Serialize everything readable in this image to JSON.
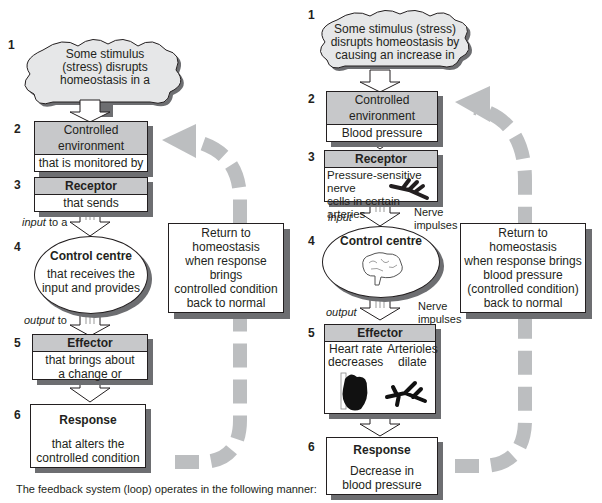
{
  "left": {
    "steps": [
      {
        "num": "1",
        "text_lines": [
          "Some stimulus",
          "(stress) disrupts",
          "homeostasis in a"
        ]
      },
      {
        "num": "2",
        "header": "Controlled environment",
        "body": "that is monitored by"
      },
      {
        "num": "3",
        "header": "Receptor",
        "body": "that sends"
      },
      {
        "num": "4",
        "header": "Control centre",
        "body_lines": [
          "that receives the",
          "input and provides"
        ]
      },
      {
        "num": "5",
        "header": "Effector",
        "body_lines": [
          "that brings about",
          "a change or"
        ]
      },
      {
        "num": "6",
        "header": "Response",
        "body_lines": [
          "that alters the",
          "controlled condition"
        ]
      }
    ],
    "input_label_italic": "input",
    "input_label_rest": " to a",
    "output_label_italic": "output",
    "output_label_rest": " to",
    "return_note_lines": [
      "Return to homeostasis",
      "when response brings",
      "controlled condition",
      "back to normal"
    ]
  },
  "right": {
    "steps": [
      {
        "num": "1",
        "text_lines": [
          "Some stimulus (stress)",
          "disrupts homeostasis by",
          "causing an increase in"
        ]
      },
      {
        "num": "2",
        "header": "Controlled environment",
        "body": "Blood pressure"
      },
      {
        "num": "3",
        "header": "Receptor",
        "body_lines": [
          "Pressure-sensitive nerve",
          "cells in certain",
          "arteries"
        ]
      },
      {
        "num": "4",
        "header": "Control centre"
      },
      {
        "num": "5",
        "header": "Effector",
        "col1_lines": [
          "Heart rate",
          "decreases"
        ],
        "col2_lines": [
          "Arterioles",
          "dilate"
        ]
      },
      {
        "num": "6",
        "header": "Response",
        "body_lines": [
          "Decrease in",
          "blood pressure"
        ]
      }
    ],
    "input_label": "input",
    "output_label": "output",
    "nerve_impulses_1": [
      "Nerve",
      "impulses"
    ],
    "nerve_impulses_2": [
      "Nerve",
      "impulses"
    ],
    "return_note_lines": [
      "Return to homeostasis",
      "when response brings",
      "blood pressure",
      "(controlled condition)",
      "back to normal"
    ]
  },
  "caption": "The feedback system (loop) operates in the following manner:",
  "colors": {
    "header_gray": "#c7c8ca",
    "shadow": "#6d6e71",
    "loop_arrow": "#bcbec0",
    "stroke": "#231f20"
  }
}
